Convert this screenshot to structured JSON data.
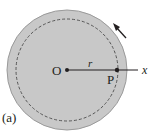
{
  "figure": {
    "panel_label": "(a)",
    "center_label": "O",
    "point_label": "P",
    "radius_label": "r",
    "axis_label": "x",
    "colors": {
      "disk_fill": "#c8c8c8",
      "disk_edge": "#9a9a9a",
      "ink": "#231f20",
      "background": "#ffffff"
    },
    "rotation_direction": "counterclockwise"
  }
}
